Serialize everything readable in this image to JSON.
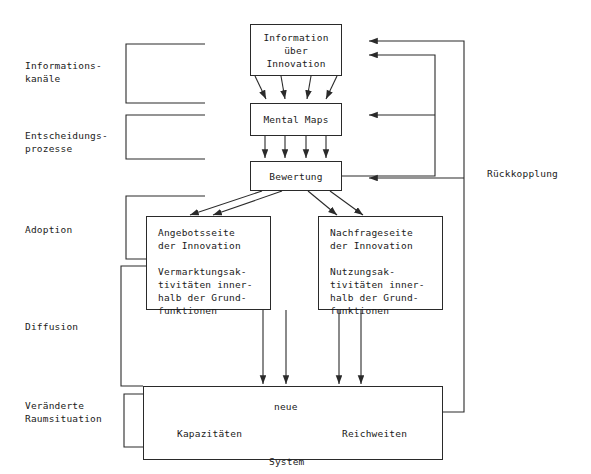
{
  "diagram": {
    "stage_labels": [
      {
        "id": "informationskanaele",
        "text": "Informations-\nkanäle"
      },
      {
        "id": "entscheidungsprozesse",
        "text": "Entscheidungs-\nprozesse"
      },
      {
        "id": "adoption",
        "text": "Adoption"
      },
      {
        "id": "diffusion",
        "text": "Diffusion"
      },
      {
        "id": "veraenderte-raumsituation",
        "text": "Veränderte\nRaumsituation"
      }
    ],
    "nodes": {
      "information": "Information\nüber\nInnovation",
      "mental_maps": "Mental Maps",
      "bewertung": "Bewertung",
      "angebotsseite_head": "Angebotsseite\nder Innovation",
      "angebotsseite_body": "Vermarktungsak-\ntivitäten inner-\nhalb der Grund-\nfunktionen",
      "nachfrageseite_head": "Nachfrageseite\nder Innovation",
      "nachfrageseite_body": "Nutzungsak-\ntivitäten inner-\nhalb der Grund-\nfunktionen",
      "system_neue": "neue",
      "system_kapazitaeten": "Kapazitäten",
      "system_reichweiten": "Reichweiten",
      "system_system": "System"
    },
    "feedback_label": "Rückkopplung",
    "colors": {
      "line": "#2a2a2a",
      "text": "#1a1a1a",
      "background": "#ffffff"
    }
  }
}
